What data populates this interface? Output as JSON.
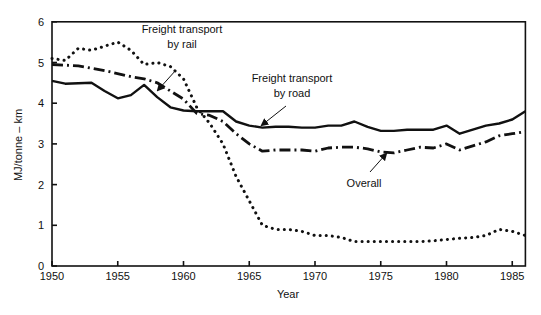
{
  "chart_data": {
    "type": "line",
    "title": "",
    "xlabel": "Year",
    "ylabel": "MJ/tonne – km",
    "xlim": [
      1950,
      1986
    ],
    "ylim": [
      0,
      6
    ],
    "xticks": [
      1950,
      1955,
      1960,
      1965,
      1970,
      1975,
      1980,
      1985
    ],
    "yticks": [
      0,
      1,
      2,
      3,
      4,
      5,
      6
    ],
    "grid": false,
    "legend": "inline annotations",
    "series": [
      {
        "name": "Freight transport by road",
        "style": "solid",
        "x": [
          1950,
          1951,
          1953,
          1954,
          1955,
          1956,
          1957,
          1958,
          1959,
          1960,
          1961,
          1962,
          1963,
          1964,
          1965,
          1966,
          1967,
          1968,
          1969,
          1970,
          1971,
          1972,
          1973,
          1974,
          1975,
          1976,
          1977,
          1978,
          1979,
          1980,
          1981,
          1982,
          1983,
          1984,
          1985,
          1986
        ],
        "values": [
          4.55,
          4.48,
          4.5,
          4.3,
          4.12,
          4.2,
          4.45,
          4.15,
          3.9,
          3.82,
          3.8,
          3.8,
          3.8,
          3.55,
          3.45,
          3.4,
          3.42,
          3.42,
          3.4,
          3.4,
          3.45,
          3.45,
          3.55,
          3.42,
          3.32,
          3.32,
          3.35,
          3.35,
          3.35,
          3.45,
          3.25,
          3.35,
          3.45,
          3.5,
          3.6,
          3.8
        ]
      },
      {
        "name": "Freight transport by rail",
        "style": "dotted",
        "x": [
          1950,
          1951,
          1952,
          1953,
          1954,
          1955,
          1956,
          1957,
          1958,
          1959,
          1960,
          1961,
          1962,
          1963,
          1964,
          1965,
          1966,
          1967,
          1968,
          1969,
          1970,
          1971,
          1972,
          1973,
          1975,
          1977,
          1978,
          1979,
          1980,
          1981,
          1982,
          1983,
          1984,
          1985,
          1986
        ],
        "values": [
          5.1,
          5.05,
          5.35,
          5.3,
          5.4,
          5.5,
          5.3,
          4.95,
          5.0,
          4.9,
          4.6,
          3.9,
          3.5,
          3.0,
          2.2,
          1.6,
          1.0,
          0.9,
          0.9,
          0.85,
          0.75,
          0.75,
          0.7,
          0.6,
          0.6,
          0.6,
          0.6,
          0.62,
          0.65,
          0.68,
          0.7,
          0.75,
          0.9,
          0.85,
          0.75
        ]
      },
      {
        "name": "Overall",
        "style": "dash-dot",
        "x": [
          1950,
          1952,
          1954,
          1956,
          1957,
          1958,
          1959,
          1960,
          1961,
          1962,
          1963,
          1964,
          1965,
          1966,
          1967,
          1968,
          1969,
          1970,
          1971,
          1972,
          1973,
          1974,
          1975,
          1976,
          1977,
          1978,
          1979,
          1980,
          1981,
          1982,
          1983,
          1984,
          1985,
          1986
        ],
        "values": [
          4.95,
          4.92,
          4.8,
          4.65,
          4.6,
          4.5,
          4.3,
          4.1,
          3.75,
          3.7,
          3.55,
          3.25,
          3.0,
          2.82,
          2.85,
          2.85,
          2.85,
          2.82,
          2.9,
          2.92,
          2.92,
          2.88,
          2.8,
          2.78,
          2.85,
          2.92,
          2.9,
          3.0,
          2.85,
          2.95,
          3.05,
          3.2,
          3.25,
          3.3
        ]
      }
    ],
    "annotations": [
      {
        "lines": [
          "Freight transport",
          "by rail"
        ],
        "x": 182,
        "y": 33,
        "arrow": [
          [
            176,
            70
          ],
          [
            158,
            90
          ]
        ]
      },
      {
        "lines": [
          "Freight transport",
          "by road"
        ],
        "x": 292,
        "y": 82,
        "arrow": [
          [
            286,
            106
          ],
          [
            262,
            125
          ]
        ]
      },
      {
        "lines": [
          "Overall"
        ],
        "x": 364,
        "y": 187,
        "arrow": [
          [
            370,
            172
          ],
          [
            386,
            154
          ]
        ]
      }
    ]
  }
}
